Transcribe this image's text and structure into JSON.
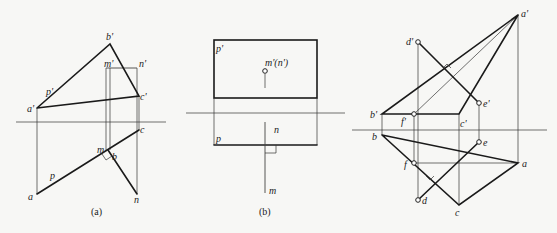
{
  "figures": [
    {
      "id": "a",
      "caption": "(a)",
      "labels": {
        "b_prime": "b'",
        "m_prime": "m'",
        "n_prime": "n'",
        "p_prime": "p'",
        "a_prime": "a'",
        "c_prime": "c'",
        "c": "c",
        "m": "m",
        "b": "b",
        "p": "p",
        "a": "a",
        "n": "n"
      }
    },
    {
      "id": "b",
      "caption": "(b)",
      "labels": {
        "p_prime": "p'",
        "mn_prime": "m'(n')",
        "n": "n",
        "p": "p",
        "m": "m"
      }
    },
    {
      "id": "c",
      "caption": "",
      "labels": {
        "a_prime": "a'",
        "d_prime": "d'",
        "e_prime": "e'",
        "b_prime": "b'",
        "f_prime": "f'",
        "c_prime": "c'",
        "b": "b",
        "e": "e",
        "f": "f",
        "a": "a",
        "d": "d",
        "c": "c"
      }
    }
  ],
  "colors": {
    "line": "#1a1a1a",
    "background": "#f7f7f5"
  }
}
